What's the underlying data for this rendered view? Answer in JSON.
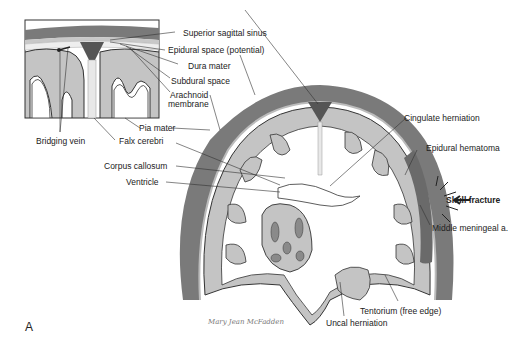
{
  "figure": {
    "panel_label": "A",
    "signature": "Mary Jean McFadden",
    "colors": {
      "skull": "#7a7a7a",
      "dura": "#9a9a9a",
      "cortex": "#c4c4c4",
      "sinus": "#555555",
      "hematoma": "#6a6a6a",
      "background": "#ffffff",
      "line": "#333333"
    },
    "inset_labels": {
      "bridging_vein": "Bridging vein",
      "falx_cerebri": "Falx cerebri",
      "pia_mater": "Pia mater",
      "arachnoid_membrane_1": "Arachnoid",
      "arachnoid_membrane_2": "membrane",
      "subdural_space": "Subdural space",
      "dura_mater": "Dura mater",
      "epidural_space": "Epidural space (potential)",
      "superior_sagittal_sinus": "Superior sagittal sinus"
    },
    "main_labels": {
      "corpus_callosum": "Corpus callosum",
      "ventricle": "Ventricle",
      "cingulate_herniation": "Cingulate herniation",
      "epidural_hematoma": "Epidural hematoma",
      "skull_fracture": "Skull fracture",
      "middle_meningeal": "Middle meningeal a.",
      "tentorium": "Tentorium (free edge)",
      "uncal_herniation": "Uncal herniation"
    }
  }
}
